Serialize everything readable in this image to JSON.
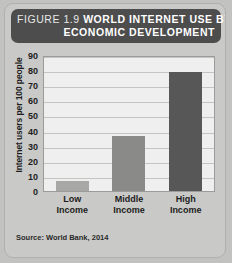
{
  "figure": {
    "number_label": "FIGURE 1.9",
    "title": "WORLD INTERNET USE BY",
    "title_line2": "ECONOMIC DEVELOPMENT",
    "source": "Source: World Bank, 2014"
  },
  "colors": {
    "title_bar": "#4d4d4d",
    "card_background": "#c9c9c7",
    "plot_background": "#efefef",
    "gridline": "#c4c4c2",
    "bar_low": "#a8a8a6",
    "bar_middle": "#8a8a88",
    "bar_high": "#575757"
  },
  "chart_data": {
    "type": "bar",
    "title": "FIGURE 1.9 WORLD INTERNET USE BY ECONOMIC DEVELOPMENT",
    "categories": [
      "Low\nIncome",
      "Middle\nIncome",
      "High\nIncome"
    ],
    "category_lines": [
      [
        "Low",
        "Income"
      ],
      [
        "Middle",
        "Income"
      ],
      [
        "High",
        "Income"
      ]
    ],
    "values": [
      7,
      37,
      80
    ],
    "bar_colors": [
      "#a8a8a6",
      "#8a8a88",
      "#575757"
    ],
    "xlabel": "",
    "ylabel": "Internet users per 100 people",
    "ylim": [
      0,
      90
    ],
    "ytick_step": 10,
    "yticks": [
      90,
      80,
      70,
      60,
      50,
      40,
      30,
      20,
      10,
      0
    ],
    "grid": true,
    "legend": false,
    "source": "Source: World Bank, 2014"
  }
}
